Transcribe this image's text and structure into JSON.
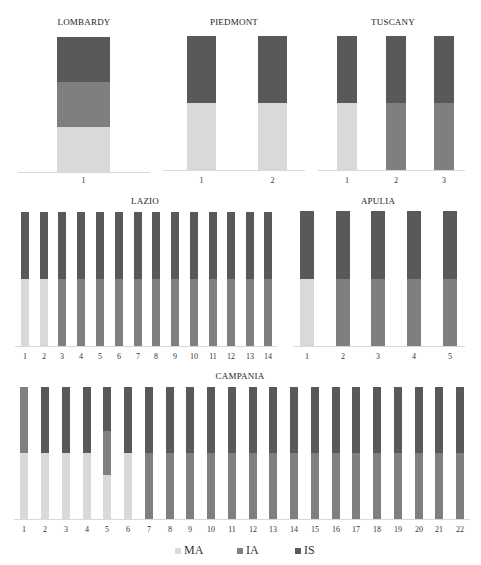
{
  "chart_data": {
    "type": "bar",
    "stacked": true,
    "normalized": true,
    "legend": {
      "position": "bottom",
      "entries": [
        {
          "name": "MA",
          "color": "#d9d9d9"
        },
        {
          "name": "IA",
          "color": "#7f7f7f"
        },
        {
          "name": "IS",
          "color": "#595959"
        }
      ]
    },
    "grid": false,
    "panels": [
      {
        "title": "LOMBARDY",
        "categories": [
          "1"
        ],
        "series": [
          {
            "name": "MA",
            "values": [
              33.3
            ]
          },
          {
            "name": "IA",
            "values": [
              33.3
            ]
          },
          {
            "name": "IS",
            "values": [
              33.3
            ]
          }
        ]
      },
      {
        "title": "PIEDMONT",
        "categories": [
          "1",
          "2"
        ],
        "series": [
          {
            "name": "MA",
            "values": [
              50,
              50
            ]
          },
          {
            "name": "IA",
            "values": [
              0,
              0
            ]
          },
          {
            "name": "IS",
            "values": [
              50,
              50
            ]
          }
        ]
      },
      {
        "title": "TUSCANY",
        "categories": [
          "1",
          "2",
          "3"
        ],
        "series": [
          {
            "name": "MA",
            "values": [
              50,
              0,
              0
            ]
          },
          {
            "name": "IA",
            "values": [
              0,
              50,
              50
            ]
          },
          {
            "name": "IS",
            "values": [
              50,
              50,
              50
            ]
          }
        ]
      },
      {
        "title": "LAZIO",
        "categories": [
          "1",
          "2",
          "3",
          "4",
          "5",
          "6",
          "7",
          "8",
          "9",
          "10",
          "11",
          "12",
          "13",
          "14"
        ],
        "series": [
          {
            "name": "MA",
            "values": [
              50,
              50,
              0,
              0,
              0,
              0,
              0,
              0,
              0,
              0,
              0,
              0,
              0,
              0
            ]
          },
          {
            "name": "IA",
            "values": [
              0,
              0,
              50,
              50,
              50,
              50,
              50,
              50,
              50,
              50,
              50,
              50,
              50,
              50
            ]
          },
          {
            "name": "IS",
            "values": [
              50,
              50,
              50,
              50,
              50,
              50,
              50,
              50,
              50,
              50,
              50,
              50,
              50,
              50
            ]
          }
        ]
      },
      {
        "title": "APULIA",
        "categories": [
          "1",
          "2",
          "3",
          "4",
          "5"
        ],
        "series": [
          {
            "name": "MA",
            "values": [
              50,
              0,
              0,
              0,
              0
            ]
          },
          {
            "name": "IA",
            "values": [
              0,
              50,
              50,
              50,
              50
            ]
          },
          {
            "name": "IS",
            "values": [
              50,
              50,
              50,
              50,
              50
            ]
          }
        ]
      },
      {
        "title": "CAMPANIA",
        "categories": [
          "1",
          "2",
          "3",
          "4",
          "5",
          "6",
          "7",
          "8",
          "9",
          "10",
          "11",
          "12",
          "13",
          "14",
          "15",
          "16",
          "17",
          "18",
          "19",
          "20",
          "21",
          "22"
        ],
        "series": [
          {
            "name": "MA",
            "values": [
              50,
              50,
              50,
              50,
              33.3,
              50,
              0,
              0,
              0,
              0,
              0,
              0,
              0,
              0,
              0,
              0,
              0,
              0,
              0,
              0,
              0,
              0
            ]
          },
          {
            "name": "IA",
            "values": [
              50,
              0,
              0,
              0,
              33.3,
              0,
              50,
              50,
              50,
              50,
              50,
              50,
              50,
              50,
              50,
              50,
              50,
              50,
              50,
              50,
              50,
              50
            ]
          },
          {
            "name": "IS",
            "values": [
              0,
              50,
              50,
              50,
              33.3,
              50,
              50,
              50,
              50,
              50,
              50,
              50,
              50,
              50,
              50,
              50,
              50,
              50,
              50,
              50,
              50,
              50
            ]
          }
        ]
      }
    ],
    "xlabel": "",
    "ylabel": "",
    "ylim": [
      0,
      100
    ]
  },
  "layout": {
    "panels": [
      {
        "title_x": 84,
        "title_y": 17,
        "top": 37,
        "bottom": 172,
        "axis_x1": 18,
        "axis_x2": 150,
        "tick_y": 176,
        "bar_x": [
          57
        ],
        "bar_w": 53
      },
      {
        "title_x": 234,
        "title_y": 17,
        "top": 36,
        "bottom": 170,
        "axis_x1": 163,
        "axis_x2": 305,
        "tick_y": 176,
        "bar_x": [
          187,
          258
        ],
        "bar_w": 29
      },
      {
        "title_x": 393,
        "title_y": 17,
        "top": 36,
        "bottom": 170,
        "axis_x1": 318,
        "axis_x2": 465,
        "tick_y": 176,
        "bar_x": [
          337,
          386,
          434
        ],
        "bar_w": 20
      },
      {
        "title_x": 145,
        "title_y": 196,
        "top": 212,
        "bottom": 346,
        "axis_x1": 15,
        "axis_x2": 277,
        "tick_y": 352,
        "bar_x": [
          21,
          40,
          58,
          77,
          96,
          115,
          134,
          152,
          171,
          190,
          209,
          227,
          246,
          264
        ],
        "bar_w": 8
      },
      {
        "title_x": 378,
        "title_y": 196,
        "top": 211,
        "bottom": 346,
        "axis_x1": 293,
        "axis_x2": 465,
        "tick_y": 352,
        "bar_x": [
          300,
          336,
          371,
          407,
          443
        ],
        "bar_w": 14
      },
      {
        "title_x": 240,
        "title_y": 371,
        "top": 387,
        "bottom": 519,
        "axis_x1": 14,
        "axis_x2": 470,
        "tick_y": 525,
        "bar_x": [
          20,
          41,
          62,
          83,
          103,
          124,
          145,
          166,
          186,
          207,
          228,
          249,
          269,
          290,
          311,
          332,
          352,
          373,
          394,
          415,
          435,
          456
        ],
        "bar_w": 8
      }
    ],
    "legend_x": [
      175,
      237,
      295
    ]
  }
}
